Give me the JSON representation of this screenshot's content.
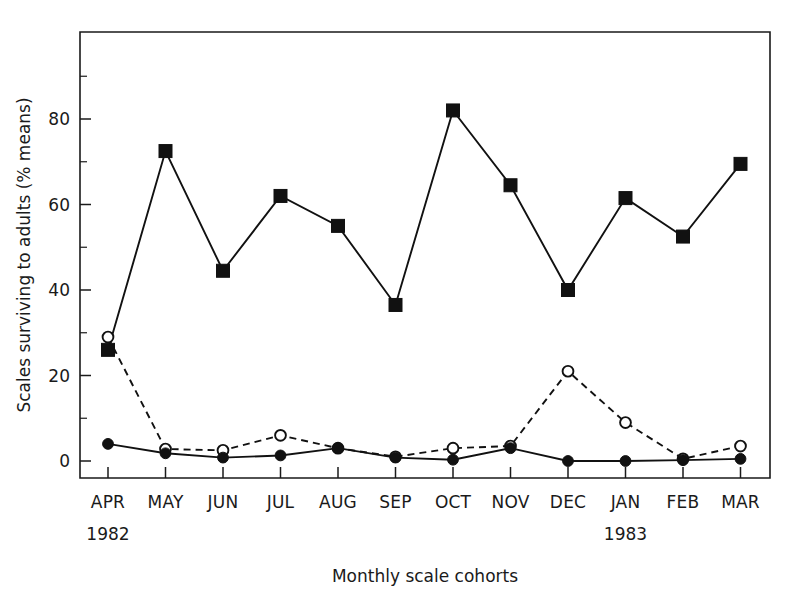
{
  "chart_data": {
    "type": "line",
    "title": "",
    "xlabel": "Monthly scale cohorts",
    "ylabel": "Scales surviving to adults (% means)",
    "categories": [
      "APR",
      "MAY",
      "JUN",
      "JUL",
      "AUG",
      "SEP",
      "OCT",
      "NOV",
      "DEC",
      "JAN",
      "FEB",
      "MAR"
    ],
    "year_labels": [
      {
        "text": "1982",
        "category": "APR"
      },
      {
        "text": "1983",
        "category": "JAN"
      }
    ],
    "ylim": [
      0,
      95
    ],
    "xlim_pad": 0.55,
    "y_ticks_major": [
      0,
      20,
      40,
      60,
      80
    ],
    "y_tick_labels": [
      "0",
      "20",
      "40",
      "60",
      "80"
    ],
    "y_ticks_minor": [
      10,
      30,
      50,
      70,
      90
    ],
    "grid": false,
    "legend": "none",
    "series": [
      {
        "name": "filled-square-solid",
        "marker": "filled-square",
        "line": "solid",
        "values": [
          26,
          72.5,
          44.5,
          62,
          55,
          36.5,
          82,
          64.5,
          40,
          61.5,
          52.5,
          69.5
        ]
      },
      {
        "name": "open-circle-dashed",
        "marker": "open-circle",
        "line": "dashed",
        "values": [
          29,
          2.8,
          2.5,
          6,
          3,
          1,
          3,
          3.5,
          21,
          9,
          0.5,
          3.5
        ]
      },
      {
        "name": "filled-circle-solid",
        "marker": "filled-circle",
        "line": "solid",
        "values": [
          4,
          1.8,
          0.8,
          1.3,
          3,
          0.8,
          0.3,
          3,
          0,
          0,
          0.2,
          0.5
        ]
      }
    ]
  },
  "colors": {
    "ink": "#111111",
    "background": "#ffffff"
  }
}
